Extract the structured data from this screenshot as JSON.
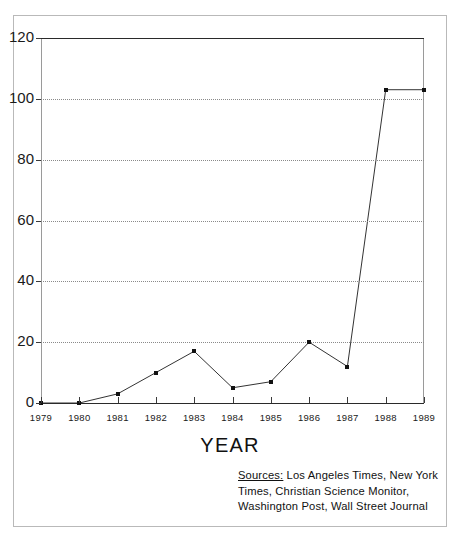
{
  "chart_data": {
    "type": "line",
    "title": "",
    "xlabel": "YEAR",
    "ylabel": "",
    "categories": [
      "1979",
      "1980",
      "1981",
      "1982",
      "1983",
      "1984",
      "1985",
      "1986",
      "1987",
      "1988",
      "1989"
    ],
    "x": [
      1979,
      1980,
      1981,
      1982,
      1983,
      1984,
      1985,
      1986,
      1987,
      1988,
      1989
    ],
    "values": [
      0,
      0,
      3,
      10,
      17,
      5,
      7,
      20,
      12,
      103,
      103
    ],
    "series": [
      {
        "name": "",
        "values": [
          0,
          0,
          3,
          10,
          17,
          5,
          7,
          20,
          12,
          103,
          103
        ]
      }
    ],
    "ylim": [
      0,
      120
    ],
    "xlim": [
      1979,
      1989
    ],
    "yticks": [
      0,
      20,
      40,
      60,
      80,
      100,
      120
    ],
    "ytick_labels": [
      "0",
      "20",
      "40",
      "60",
      "80",
      "100",
      "120"
    ],
    "xtick_labels": [
      "1979",
      "1980",
      "1981",
      "1982",
      "1983",
      "1984",
      "1985",
      "1986",
      "1987",
      "1988",
      "1989"
    ],
    "grid": true,
    "grid_style": "dotted",
    "legend": "none",
    "marker": "square",
    "line_color": "#333333",
    "marker_color": "#111111"
  },
  "axis": {
    "x_title": "YEAR"
  },
  "sources": {
    "label": "Sources:",
    "line1": " Los Angeles Times,  New York",
    "line2": "Times,  Christian Science Monitor,",
    "line3": "Washington Post,  Wall Street Journal",
    "full_text": "Sources: Los Angeles Times, New York Times, Christian Science Monitor, Washington Post, Wall Street Journal"
  },
  "colors": {
    "frame": "#b9b9b9",
    "axis": "#2a2a2a",
    "grid": "#8a8a8a",
    "line": "#333333",
    "marker": "#111111",
    "background": "#ffffff"
  }
}
